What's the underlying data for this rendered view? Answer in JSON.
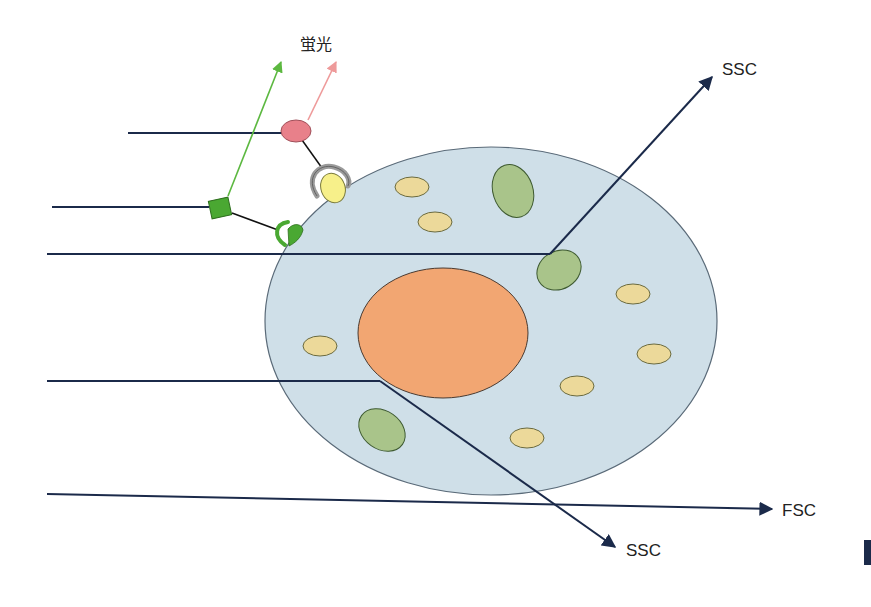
{
  "diagram": {
    "labels": {
      "fluorescence": "蛍光",
      "ssc_top": "SSC",
      "ssc_bottom": "SSC",
      "fsc": "FSC"
    },
    "colors": {
      "laser_line": "#1b2a4a",
      "cell_fill": "#cfdfe8",
      "cell_stroke": "#5a6a78",
      "nucleus_fill": "#f2a672",
      "organelle_yellow": "#ecd99a",
      "organelle_green": "#a9c48a",
      "fluor_green": "#4aa832",
      "fluor_green_arrow": "#5cb840",
      "fluor_red": "#e8808a",
      "fluor_red_arrow": "#ee9a9a",
      "antigen_yellow": "#f7f08a",
      "receptor_gray": "#9a9a9a"
    },
    "components": [
      "incident laser beams",
      "cell",
      "nucleus",
      "organelles",
      "green fluorophore-antibody",
      "red fluorophore-antibody",
      "forward scatter",
      "side scatter"
    ]
  }
}
